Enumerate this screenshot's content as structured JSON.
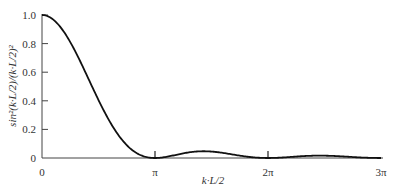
{
  "chart_data": {
    "type": "line",
    "title": "",
    "xlabel": "k·L/2",
    "ylabel": "sin²(k·L/2)/(k·L/2)²",
    "x_ticks": [
      "0",
      "π",
      "2π",
      "3π"
    ],
    "y_ticks": [
      "0",
      "0.2",
      "0.4",
      "0.6",
      "0.8",
      "1.0"
    ],
    "xlim": [
      0,
      9.4248
    ],
    "ylim": [
      0,
      1.0
    ],
    "grid": false,
    "legend": null,
    "series": [
      {
        "name": "sin²(u)/u²",
        "x": [
          0,
          0.5,
          1.0,
          1.5,
          2.0,
          2.5,
          3.1416,
          3.5,
          4.0,
          4.4934,
          5.0,
          5.5,
          6.2832,
          7.0,
          7.7253,
          8.5,
          9.4248
        ],
        "values": [
          1.0,
          0.919,
          0.708,
          0.442,
          0.207,
          0.057,
          0.0,
          0.01,
          0.036,
          0.047,
          0.037,
          0.016,
          0.0,
          0.009,
          0.016,
          0.009,
          0.0
        ]
      }
    ]
  }
}
